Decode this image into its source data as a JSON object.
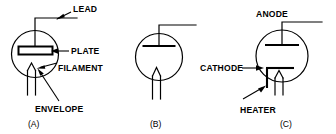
{
  "figure": {
    "background_color": "#ffffff",
    "line_color": "#000000",
    "width": 336,
    "height": 134
  },
  "panels": [
    {
      "id": "A",
      "caption": "(A)",
      "description": "Directly heated diode vacuum tube with labeled parts",
      "labels": [
        {
          "key": "lead",
          "text": "LEAD"
        },
        {
          "key": "plate",
          "text": "PLATE"
        },
        {
          "key": "filament",
          "text": "FILAMENT"
        },
        {
          "key": "envelope",
          "text": "ENVELOPE"
        }
      ]
    },
    {
      "id": "B",
      "caption": "(B)",
      "description": "Directly heated diode vacuum tube symbol, unlabeled",
      "labels": []
    },
    {
      "id": "C",
      "caption": "(C)",
      "description": "Indirectly heated diode vacuum tube with labeled parts",
      "labels": [
        {
          "key": "anode",
          "text": "ANODE"
        },
        {
          "key": "cathode",
          "text": "CATHODE"
        },
        {
          "key": "heater",
          "text": "HEATER"
        }
      ]
    }
  ]
}
